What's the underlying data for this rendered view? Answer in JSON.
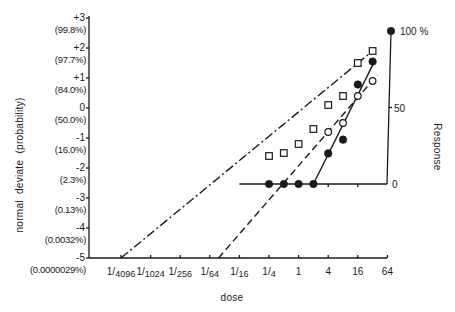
{
  "chart_data": {
    "type": "scatter",
    "title": "",
    "xlabel": "dose",
    "ylabel": "normal  deviate  (probability)",
    "y2label": "Response",
    "x_scale": "log4",
    "x_ticks": [
      "1/4096",
      "1/1024",
      "1/256",
      "1/64",
      "1/16",
      "1/4",
      "1",
      "4",
      "16",
      "64"
    ],
    "x_tick_values": [
      0.000244,
      0.000977,
      0.00391,
      0.0156,
      0.0625,
      0.25,
      1,
      4,
      16,
      64
    ],
    "y_ticks": [
      {
        "value": 3,
        "label": "+3",
        "prob": "(99.8%)"
      },
      {
        "value": 2,
        "label": "+2",
        "prob": "(97.7%)"
      },
      {
        "value": 1,
        "label": "+1",
        "prob": "(84.0%)"
      },
      {
        "value": 0,
        "label": "0",
        "prob": "(50.0%)"
      },
      {
        "value": -1,
        "label": "-1",
        "prob": "(16.0%)"
      },
      {
        "value": -2,
        "label": "-2",
        "prob": "(2.3%)"
      },
      {
        "value": -3,
        "label": "-3",
        "prob": "(0.13%)"
      },
      {
        "value": -4,
        "label": "-4",
        "prob": "(0.0032%)"
      },
      {
        "value": -5,
        "label": "-5",
        "prob": "(0.0000029%)"
      }
    ],
    "ylim": [
      -5,
      3
    ],
    "y2_ticks": [
      {
        "value": 0,
        "label": "0"
      },
      {
        "value": 50,
        "label": "50"
      },
      {
        "value": 100,
        "label": "100 %"
      }
    ],
    "y2lim": [
      0,
      100
    ],
    "y2_x_range": [
      "1/16",
      "64"
    ],
    "series": [
      {
        "name": "squares (normal deviate)",
        "marker": "open-square",
        "axis": "left",
        "fit_line": "dash-dot",
        "points": [
          {
            "dose": 0.25,
            "y": -1.6
          },
          {
            "dose": 0.5,
            "y": -1.5
          },
          {
            "dose": 1,
            "y": -1.2
          },
          {
            "dose": 2,
            "y": -0.7
          },
          {
            "dose": 4,
            "y": 0.1
          },
          {
            "dose": 8,
            "y": 0.4
          },
          {
            "dose": 16,
            "y": 1.5
          },
          {
            "dose": 32,
            "y": 1.9
          }
        ],
        "line": [
          {
            "dose": 0.000244,
            "y": -5
          },
          {
            "dose": 32,
            "y": 1.9
          }
        ]
      },
      {
        "name": "open circles (normal deviate)",
        "marker": "open-circle",
        "axis": "left",
        "fit_line": "dashed",
        "points": [
          {
            "dose": 4,
            "y": -0.8
          },
          {
            "dose": 8,
            "y": -0.5
          },
          {
            "dose": 16,
            "y": 0.4
          },
          {
            "dose": 32,
            "y": 0.9
          }
        ],
        "line": [
          {
            "dose": 0.0235,
            "y": -5
          },
          {
            "dose": 40,
            "y": 1.1
          }
        ]
      },
      {
        "name": "filled circles (response %)",
        "marker": "filled-circle",
        "axis": "right",
        "fit_line": "solid",
        "points": [
          {
            "dose": 0.25,
            "y": 0
          },
          {
            "dose": 0.5,
            "y": 0
          },
          {
            "dose": 1,
            "y": 0
          },
          {
            "dose": 2,
            "y": 0
          },
          {
            "dose": 4,
            "y": 20
          },
          {
            "dose": 8,
            "y": 29
          },
          {
            "dose": 16,
            "y": 65
          },
          {
            "dose": 32,
            "y": 80
          },
          {
            "dose": 64,
            "y": 100
          }
        ],
        "line": [
          {
            "dose": 2,
            "y": 0
          },
          {
            "dose": 36,
            "y": 81
          }
        ]
      }
    ],
    "grid": false,
    "legend": "none"
  },
  "colors": {
    "ink": "#1a1a1a",
    "background": "#ffffff"
  }
}
